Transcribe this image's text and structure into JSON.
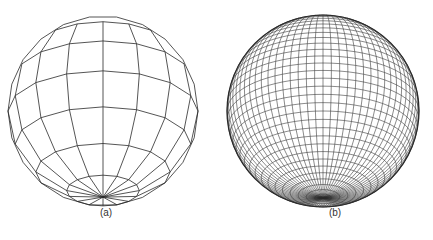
{
  "figure": {
    "panels": [
      {
        "id": "a",
        "caption": "(a)",
        "description": "Coarse polygonal (faceted) sphere wireframe",
        "center": [
          103,
          111
        ],
        "radius": 95,
        "meridians": 16,
        "parallels": 8,
        "tilt_deg": 25,
        "smooth_outline": false
      },
      {
        "id": "b",
        "caption": "(b)",
        "description": "Finely tessellated sphere wireframe",
        "center": [
          107,
          111
        ],
        "radius": 96,
        "meridians": 72,
        "parallels": 36,
        "tilt_deg": 25,
        "smooth_outline": true
      }
    ],
    "colors": {
      "line": "#2a2a2a",
      "background": "#ffffff",
      "caption": "#333333"
    }
  }
}
